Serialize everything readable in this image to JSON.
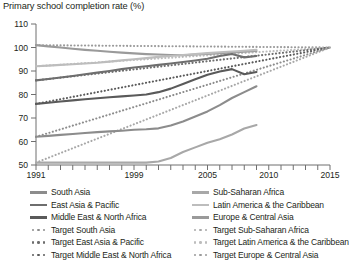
{
  "title": "Primary school completion rate (%)",
  "axes": {
    "yticks": [
      50,
      60,
      70,
      80,
      90,
      100,
      110
    ],
    "ylim": [
      50,
      110
    ],
    "xlim": [
      1991,
      2015
    ],
    "xticks_labeled": [
      1991,
      1999,
      2005,
      2010,
      2015
    ]
  },
  "legend": {
    "left": [
      {
        "label": "South Asia",
        "style": "solid",
        "color": "#8c8c8c"
      },
      {
        "label": "East Asia & Pacific",
        "style": "solid",
        "color": "#6e6e6e"
      },
      {
        "label": "Middle East & North Africa",
        "style": "solid",
        "color": "#5a5a5a"
      },
      {
        "label": "Target South Asia",
        "style": "dotted",
        "color": "#8c8c8c"
      },
      {
        "label": "Target East Asia & Pacific",
        "style": "dotted",
        "color": "#6e6e6e"
      },
      {
        "label": "Target Middle East & North Africa",
        "style": "dotted",
        "color": "#5a5a5a"
      }
    ],
    "right": [
      {
        "label": "Sub-Saharan Africa",
        "style": "solid",
        "color": "#a8a8a8"
      },
      {
        "label": "Latin America & the Caribbean",
        "style": "solid",
        "color": "#bdbdbd"
      },
      {
        "label": "Europe & Central Asia",
        "style": "solid",
        "color": "#9a9a9a"
      },
      {
        "label": "Target Sub-Saharan Africa",
        "style": "dotted",
        "color": "#a8a8a8"
      },
      {
        "label": "Target Latin America & the Caribbean",
        "style": "dotted",
        "color": "#bdbdbd"
      },
      {
        "label": "Target Europe & Central Asia",
        "style": "dotted",
        "color": "#9a9a9a"
      }
    ]
  },
  "chart_data": {
    "type": "line",
    "title": "Primary school completion rate (%)",
    "xlabel": "",
    "ylabel": "",
    "xlim": [
      1991,
      2015
    ],
    "ylim": [
      50,
      110
    ],
    "grid": false,
    "legend_position": "bottom",
    "x": [
      1991,
      1992,
      1993,
      1994,
      1995,
      1996,
      1997,
      1998,
      1999,
      2000,
      2001,
      2002,
      2003,
      2004,
      2005,
      2006,
      2007,
      2008,
      2009
    ],
    "series": [
      {
        "name": "Europe & Central Asia",
        "style": "solid",
        "color": "#9a9a9a",
        "values": [
          101,
          100.5,
          100,
          99.5,
          99,
          98.6,
          98.2,
          97.8,
          97.5,
          97.2,
          97,
          96.8,
          96.7,
          97,
          97.3,
          97.6,
          97.9,
          98.2,
          98.5
        ]
      },
      {
        "name": "Latin America & the Caribbean",
        "style": "solid",
        "color": "#bdbdbd",
        "values": [
          92,
          92.3,
          92.6,
          92.9,
          93.2,
          93.5,
          94,
          94.5,
          95,
          95.5,
          96,
          96.4,
          96.8,
          97.2,
          97.6,
          98,
          98.3,
          98.6,
          99
        ]
      },
      {
        "name": "East Asia & Pacific",
        "style": "solid",
        "color": "#6e6e6e",
        "values": [
          86,
          86.6,
          87.2,
          87.9,
          88.6,
          89.3,
          90,
          90.8,
          91.5,
          92,
          92.6,
          93.2,
          93.8,
          94.5,
          95.2,
          96.4,
          97.2,
          95.8,
          96.4
        ]
      },
      {
        "name": "Middle East & North Africa",
        "style": "solid",
        "color": "#5a5a5a",
        "values": [
          76,
          76.5,
          77,
          77.5,
          78,
          78.4,
          78.8,
          79.2,
          79.6,
          80,
          81,
          82.5,
          84.5,
          86.5,
          88.4,
          89.8,
          90.8,
          88.6,
          89.6
        ]
      },
      {
        "name": "South Asia",
        "style": "solid",
        "color": "#8c8c8c",
        "values": [
          62,
          62.4,
          62.8,
          63.2,
          63.6,
          64,
          64.3,
          64.6,
          65,
          65.2,
          65.6,
          66.8,
          68.5,
          70.6,
          72.8,
          75.5,
          78.5,
          81,
          83.5
        ]
      },
      {
        "name": "Sub-Saharan Africa",
        "style": "solid",
        "color": "#a8a8a8",
        "values": [
          51,
          51,
          51,
          51,
          51,
          51,
          51,
          51,
          51,
          51,
          51.5,
          53,
          55.5,
          57.5,
          59.5,
          61,
          63,
          65.5,
          67
        ]
      }
    ],
    "targets": {
      "note": "Dotted lines: linear MDG trajectories from each region's 1991 value to 100% in 2015",
      "x": [
        1991,
        2015
      ],
      "series": [
        {
          "name": "Target Europe & Central Asia",
          "style": "dotted",
          "color": "#9a9a9a",
          "values": [
            101,
            100
          ]
        },
        {
          "name": "Target Latin America & the Caribbean",
          "style": "dotted",
          "color": "#bdbdbd",
          "values": [
            92,
            100
          ]
        },
        {
          "name": "Target East Asia & Pacific",
          "style": "dotted",
          "color": "#6e6e6e",
          "values": [
            86,
            100
          ]
        },
        {
          "name": "Target Middle East & North Africa",
          "style": "dotted",
          "color": "#5a5a5a",
          "values": [
            76,
            100
          ]
        },
        {
          "name": "Target South Asia",
          "style": "dotted",
          "color": "#8c8c8c",
          "values": [
            62,
            100
          ]
        },
        {
          "name": "Target Sub-Saharan Africa",
          "style": "dotted",
          "color": "#a8a8a8",
          "values": [
            51,
            100
          ]
        }
      ]
    }
  }
}
